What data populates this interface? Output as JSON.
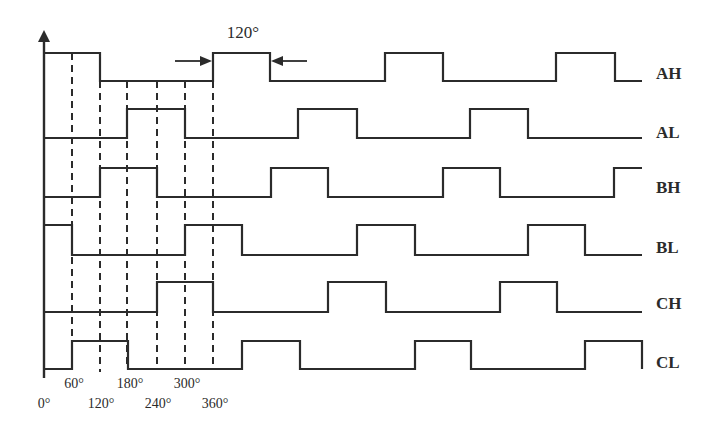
{
  "diagram": {
    "colors": {
      "stroke": "#2b2b2b",
      "background": "#ffffff"
    },
    "axis": {
      "x": 44,
      "top": 30,
      "bottom": 378
    },
    "scale": {
      "x0": 44,
      "px_per_60deg": 28.3
    },
    "annotation": {
      "label": "120°",
      "label_x": 243,
      "label_y": 38,
      "arrow_y": 61,
      "left_arrow": {
        "from": 175,
        "to": 212
      },
      "right_arrow": {
        "from": 307,
        "to": 271
      }
    },
    "signals": [
      {
        "name": "AH",
        "high_y": 53,
        "low_y": 81,
        "label_y": 79,
        "edges": [
          [
            44,
            "H"
          ],
          [
            100,
            "L"
          ],
          [
            213,
            "H"
          ],
          [
            270,
            "L"
          ],
          [
            385,
            "H"
          ],
          [
            443,
            "L"
          ],
          [
            556,
            "H"
          ],
          [
            615,
            "L"
          ],
          [
            642,
            "end"
          ]
        ]
      },
      {
        "name": "AL",
        "high_y": 109,
        "low_y": 138,
        "label_y": 138,
        "edges": [
          [
            44,
            "L"
          ],
          [
            127,
            "H"
          ],
          [
            185,
            "L"
          ],
          [
            298,
            "H"
          ],
          [
            357,
            "L"
          ],
          [
            470,
            "H"
          ],
          [
            528,
            "L"
          ],
          [
            642,
            "end"
          ]
        ]
      },
      {
        "name": "BH",
        "high_y": 168,
        "low_y": 197,
        "label_y": 193,
        "edges": [
          [
            44,
            "L"
          ],
          [
            100,
            "H"
          ],
          [
            157,
            "L"
          ],
          [
            271,
            "H"
          ],
          [
            328,
            "L"
          ],
          [
            443,
            "H"
          ],
          [
            500,
            "L"
          ],
          [
            614,
            "H"
          ],
          [
            642,
            "end"
          ]
        ]
      },
      {
        "name": "BL",
        "high_y": 225,
        "low_y": 255,
        "label_y": 253,
        "edges": [
          [
            44,
            "H"
          ],
          [
            72,
            "L"
          ],
          [
            185,
            "H"
          ],
          [
            242,
            "L"
          ],
          [
            357,
            "H"
          ],
          [
            415,
            "L"
          ],
          [
            528,
            "H"
          ],
          [
            585,
            "L"
          ],
          [
            642,
            "end"
          ]
        ]
      },
      {
        "name": "CH",
        "high_y": 282,
        "low_y": 312,
        "label_y": 309,
        "edges": [
          [
            44,
            "L"
          ],
          [
            157,
            "H"
          ],
          [
            213,
            "L"
          ],
          [
            328,
            "H"
          ],
          [
            386,
            "L"
          ],
          [
            500,
            "H"
          ],
          [
            557,
            "L"
          ],
          [
            642,
            "end"
          ]
        ]
      },
      {
        "name": "CL",
        "high_y": 341,
        "low_y": 369,
        "label_y": 368,
        "edges": [
          [
            44,
            "L"
          ],
          [
            72,
            "H"
          ],
          [
            128,
            "L"
          ],
          [
            242,
            "H"
          ],
          [
            300,
            "L"
          ],
          [
            415,
            "H"
          ],
          [
            471,
            "L"
          ],
          [
            585,
            "H"
          ],
          [
            642,
            "drop"
          ]
        ]
      }
    ],
    "signal_label_x": 656,
    "dashed_lines": [
      {
        "angle": "60°",
        "x": 72,
        "y1": 53,
        "y2": 341
      },
      {
        "angle": "120°",
        "x": 100,
        "y1": 81,
        "y2": 372
      },
      {
        "angle": "180°",
        "x": 127,
        "y1": 81,
        "y2": 369
      },
      {
        "angle": "240°",
        "x": 157,
        "y1": 81,
        "y2": 369
      },
      {
        "angle": "300°",
        "x": 185,
        "y1": 81,
        "y2": 369
      },
      {
        "angle": "360°",
        "x": 213,
        "y1": 81,
        "y2": 369
      }
    ],
    "tick_labels": [
      {
        "text": "0°",
        "x": 44,
        "y": 408
      },
      {
        "text": "60°",
        "x": 74,
        "y": 388
      },
      {
        "text": "120°",
        "x": 101,
        "y": 408
      },
      {
        "text": "180°",
        "x": 130,
        "y": 388
      },
      {
        "text": "240°",
        "x": 158,
        "y": 408
      },
      {
        "text": "300°",
        "x": 187,
        "y": 388
      },
      {
        "text": "360°",
        "x": 215,
        "y": 408
      }
    ]
  }
}
